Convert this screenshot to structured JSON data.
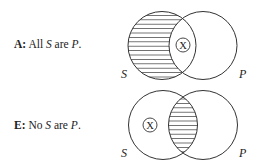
{
  "diagrams": [
    {
      "id": "A",
      "label": {
        "key": "A:",
        "pre": " All ",
        "subject": "S",
        "mid": " are ",
        "predicate": "P",
        "post": "."
      },
      "sets": {
        "left": "S",
        "right": "P"
      },
      "shaded_region": "S-only",
      "x_region": "S-and-P",
      "x_symbol": "X"
    },
    {
      "id": "E",
      "label": {
        "key": "E:",
        "pre": " No ",
        "subject": "S",
        "mid": " are ",
        "predicate": "P",
        "post": "."
      },
      "sets": {
        "left": "S",
        "right": "P"
      },
      "shaded_region": "S-and-P",
      "x_region": "S-only",
      "x_symbol": "X"
    }
  ],
  "colors": {
    "stroke": "#333333",
    "hatch": "#444444",
    "background": "#ffffff"
  }
}
